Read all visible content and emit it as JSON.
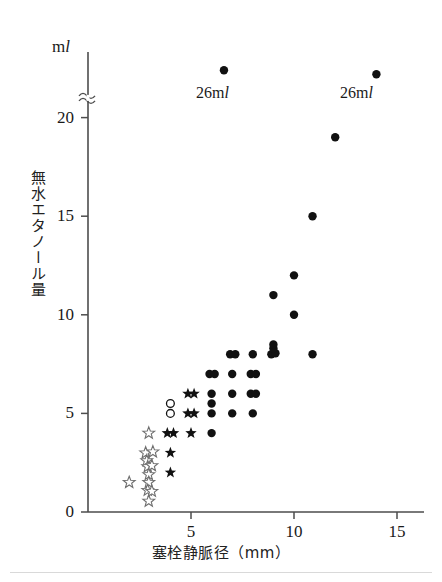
{
  "figure": {
    "unit_label": "ml",
    "y_axis_title": "無水エタノール量",
    "x_axis_title": "塞栓静脈径（mm）",
    "axis_break": "≈"
  },
  "annotations": [
    {
      "name": "open-circle-26ml",
      "marker": "open-circle",
      "text": "26ml",
      "x_mm": 6.6,
      "label_x": 196,
      "label_y": 84,
      "marker_px_x": 225,
      "marker_px_y": 71
    },
    {
      "name": "filled-circle-26ml",
      "marker": "filled-circle",
      "text": "26ml",
      "x_mm": 14.0,
      "label_x": 340,
      "label_y": 84,
      "marker_px_x": 368,
      "marker_px_y": 71
    }
  ],
  "chart_data": {
    "type": "scatter",
    "title": "",
    "xlabel": "塞栓静脈径（mm）",
    "ylabel": "無水エタノール量",
    "yunit": "ml",
    "xlim": [
      0,
      15.8
    ],
    "ylim": [
      0,
      22.5
    ],
    "xticks": [
      5,
      10,
      15
    ],
    "yticks": [
      0,
      5,
      10,
      15,
      20
    ],
    "grid": false,
    "legend": "none",
    "y_axis_broken_above": 21,
    "series": [
      {
        "name": "open-star",
        "marker": "open-star",
        "points": [
          [
            2.0,
            1.5
          ],
          [
            2.95,
            4.0
          ],
          [
            2.8,
            3.0
          ],
          [
            3.15,
            3.05
          ],
          [
            2.85,
            2.6
          ],
          [
            2.9,
            2.3
          ],
          [
            3.1,
            2.35
          ],
          [
            2.95,
            1.9
          ],
          [
            2.95,
            1.5
          ],
          [
            2.9,
            1.1
          ],
          [
            3.1,
            1.05
          ],
          [
            2.95,
            0.55
          ]
        ]
      },
      {
        "name": "filled-star",
        "marker": "filled-star",
        "points": [
          [
            4.85,
            6.0
          ],
          [
            5.15,
            6.0
          ],
          [
            4.85,
            5.0
          ],
          [
            5.15,
            5.0
          ],
          [
            3.85,
            4.0
          ],
          [
            4.15,
            4.0
          ],
          [
            5.0,
            4.0
          ],
          [
            4.0,
            3.0
          ],
          [
            4.0,
            2.0
          ]
        ]
      },
      {
        "name": "open-circle",
        "marker": "open-circle",
        "points": [
          [
            4.0,
            5.5
          ],
          [
            4.0,
            5.0
          ]
        ]
      },
      {
        "name": "filled-circle",
        "marker": "filled-circle",
        "points": [
          [
            6.0,
            4.0
          ],
          [
            6.0,
            5.0
          ],
          [
            7.0,
            5.0
          ],
          [
            8.0,
            5.0
          ],
          [
            6.0,
            5.5
          ],
          [
            6.0,
            6.0
          ],
          [
            7.0,
            6.0
          ],
          [
            7.9,
            6.0
          ],
          [
            8.15,
            6.0
          ],
          [
            5.9,
            7.0
          ],
          [
            6.15,
            7.0
          ],
          [
            7.0,
            7.0
          ],
          [
            7.9,
            7.0
          ],
          [
            8.15,
            7.0
          ],
          [
            6.9,
            8.0
          ],
          [
            7.15,
            8.0
          ],
          [
            8.0,
            8.0
          ],
          [
            8.9,
            8.0
          ],
          [
            9.1,
            8.05
          ],
          [
            9.0,
            8.3
          ],
          [
            10.9,
            8.0
          ],
          [
            9.0,
            8.5
          ],
          [
            10.0,
            10.0
          ],
          [
            9.0,
            11.0
          ],
          [
            10.0,
            12.0
          ],
          [
            10.9,
            15.0
          ],
          [
            12.0,
            19.0
          ],
          [
            14.0,
            22.2
          ],
          [
            6.6,
            22.4
          ]
        ]
      }
    ]
  }
}
